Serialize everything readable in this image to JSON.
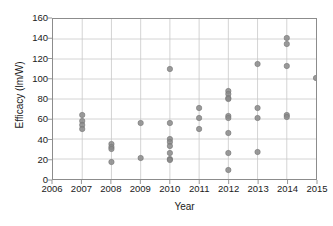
{
  "chart_data": {
    "type": "scatter",
    "title": "",
    "xlabel": "Year",
    "ylabel": "Efficacy (lm/W)",
    "xlim": [
      2006,
      2015
    ],
    "ylim": [
      0,
      160
    ],
    "xticks": [
      2006,
      2007,
      2008,
      2009,
      2010,
      2011,
      2012,
      2013,
      2014,
      2015
    ],
    "yticks": [
      0,
      20,
      40,
      60,
      80,
      100,
      120,
      140,
      160
    ],
    "xtick_labels": [
      "2006",
      "2007",
      "2008",
      "2009",
      "2010",
      "2011",
      "2012",
      "2013",
      "2014",
      "2015"
    ],
    "ytick_labels": [
      "0",
      "20",
      "40",
      "60",
      "80",
      "100",
      "120",
      "140",
      "160"
    ],
    "grid": true,
    "grid_axes": "both",
    "legend": false,
    "marker": "circle",
    "marker_color": "#8a8a8a",
    "points": [
      {
        "x": 2007,
        "y": 64
      },
      {
        "x": 2007,
        "y": 58
      },
      {
        "x": 2007,
        "y": 54
      },
      {
        "x": 2007,
        "y": 50
      },
      {
        "x": 2008,
        "y": 35
      },
      {
        "x": 2008,
        "y": 32
      },
      {
        "x": 2008,
        "y": 30
      },
      {
        "x": 2008,
        "y": 17
      },
      {
        "x": 2009,
        "y": 56
      },
      {
        "x": 2009,
        "y": 21
      },
      {
        "x": 2010,
        "y": 110
      },
      {
        "x": 2010,
        "y": 56
      },
      {
        "x": 2010,
        "y": 40
      },
      {
        "x": 2010,
        "y": 37
      },
      {
        "x": 2010,
        "y": 33
      },
      {
        "x": 2010,
        "y": 26
      },
      {
        "x": 2010,
        "y": 20
      },
      {
        "x": 2010,
        "y": 19
      },
      {
        "x": 2011,
        "y": 71
      },
      {
        "x": 2011,
        "y": 61
      },
      {
        "x": 2011,
        "y": 50
      },
      {
        "x": 2012,
        "y": 88
      },
      {
        "x": 2012,
        "y": 85
      },
      {
        "x": 2012,
        "y": 81
      },
      {
        "x": 2012,
        "y": 80
      },
      {
        "x": 2012,
        "y": 63
      },
      {
        "x": 2012,
        "y": 61
      },
      {
        "x": 2012,
        "y": 46
      },
      {
        "x": 2012,
        "y": 26
      },
      {
        "x": 2012,
        "y": 9
      },
      {
        "x": 2013,
        "y": 115
      },
      {
        "x": 2013,
        "y": 71
      },
      {
        "x": 2013,
        "y": 61
      },
      {
        "x": 2013,
        "y": 27
      },
      {
        "x": 2014,
        "y": 141
      },
      {
        "x": 2014,
        "y": 135
      },
      {
        "x": 2014,
        "y": 113
      },
      {
        "x": 2014,
        "y": 64
      },
      {
        "x": 2014,
        "y": 62
      },
      {
        "x": 2015,
        "y": 101
      }
    ]
  },
  "colors": {
    "marker": "#8a8a8a",
    "grid": "#c8c8c8",
    "frame": "#8c8c8c",
    "text": "#1a1a1a",
    "background": "#ffffff"
  }
}
